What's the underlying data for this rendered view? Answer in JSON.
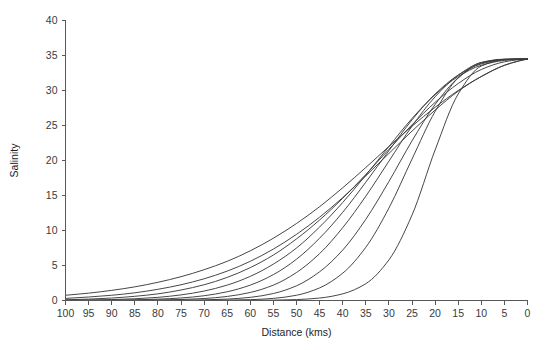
{
  "chart_data": {
    "type": "line",
    "title": "",
    "xlabel": "Distance (kms)",
    "ylabel": "Salinity",
    "xlim": [
      100,
      0
    ],
    "ylim": [
      0,
      40
    ],
    "x_reversed": true,
    "grid": false,
    "legend": "none",
    "xticks": [
      100,
      95,
      90,
      85,
      80,
      75,
      70,
      65,
      60,
      55,
      50,
      45,
      40,
      35,
      30,
      25,
      20,
      15,
      10,
      5,
      0
    ],
    "yticks": [
      0,
      5,
      10,
      15,
      20,
      25,
      30,
      35,
      40
    ],
    "xtick_labels": [
      "100",
      "95",
      "90",
      "85",
      "80",
      "75",
      "70",
      "65",
      "60",
      "55",
      "50",
      "45",
      "40",
      "35",
      "30",
      "25",
      "20",
      "15",
      "10",
      "5",
      "0"
    ],
    "ytick_labels": [
      "0",
      "5",
      "10",
      "15",
      "20",
      "25",
      "30",
      "35",
      "40"
    ],
    "mouth_salinity": 34.5,
    "x": [
      100,
      95,
      90,
      85,
      80,
      75,
      70,
      65,
      60,
      55,
      50,
      45,
      40,
      35,
      30,
      25,
      20,
      15,
      10,
      5,
      2,
      0
    ],
    "series": [
      {
        "name": "curve-1",
        "intrusion_length_km": 115,
        "values": [
          0.75,
          1.05,
          1.45,
          1.95,
          2.6,
          3.4,
          4.4,
          5.6,
          7.1,
          8.9,
          11.0,
          13.4,
          16.1,
          19.0,
          22.0,
          24.9,
          27.6,
          30.0,
          32.0,
          33.6,
          34.2,
          34.5
        ]
      },
      {
        "name": "curve-2",
        "intrusion_length_km": 98,
        "values": [
          0.3,
          0.5,
          0.75,
          1.1,
          1.6,
          2.25,
          3.1,
          4.2,
          5.6,
          7.35,
          9.45,
          11.9,
          14.7,
          17.8,
          21.0,
          24.2,
          27.2,
          29.9,
          32.0,
          33.6,
          34.2,
          34.5
        ]
      },
      {
        "name": "curve-3",
        "intrusion_length_km": 86,
        "values": [
          0.1,
          0.2,
          0.35,
          0.6,
          0.95,
          1.5,
          2.25,
          3.3,
          4.7,
          6.5,
          8.8,
          11.5,
          14.6,
          18.0,
          21.6,
          25.1,
          28.3,
          31.0,
          33.0,
          34.1,
          34.4,
          34.5
        ]
      },
      {
        "name": "curve-4",
        "intrusion_length_km": 74,
        "values": [
          0.03,
          0.07,
          0.13,
          0.25,
          0.45,
          0.8,
          1.35,
          2.2,
          3.45,
          5.2,
          7.5,
          10.5,
          14.0,
          17.9,
          22.0,
          26.0,
          29.4,
          32.0,
          33.6,
          34.3,
          34.45,
          34.5
        ]
      },
      {
        "name": "curve-5",
        "intrusion_length_km": 64,
        "values": [
          0.01,
          0.02,
          0.05,
          0.1,
          0.19,
          0.36,
          0.68,
          1.25,
          2.2,
          3.7,
          5.9,
          8.9,
          12.6,
          16.9,
          21.4,
          25.8,
          29.5,
          32.2,
          33.8,
          34.4,
          34.48,
          34.5
        ]
      },
      {
        "name": "curve-6",
        "intrusion_length_km": 54,
        "values": [
          0.0,
          0.01,
          0.02,
          0.03,
          0.07,
          0.14,
          0.28,
          0.58,
          1.15,
          2.2,
          4.0,
          6.7,
          10.4,
          14.9,
          19.9,
          24.9,
          29.1,
          32.2,
          34.0,
          34.45,
          34.5,
          34.5
        ]
      },
      {
        "name": "curve-7",
        "intrusion_length_km": 44,
        "values": [
          0.0,
          0.0,
          0.0,
          0.01,
          0.02,
          0.04,
          0.09,
          0.2,
          0.45,
          1.0,
          2.1,
          4.1,
          7.2,
          11.6,
          17.0,
          22.8,
          28.0,
          31.8,
          33.9,
          34.45,
          34.5,
          34.5
        ]
      },
      {
        "name": "curve-8",
        "intrusion_length_km": 33,
        "values": [
          0.0,
          0.0,
          0.0,
          0.0,
          0.0,
          0.01,
          0.02,
          0.05,
          0.12,
          0.3,
          0.75,
          1.8,
          3.9,
          7.6,
          13.2,
          20.2,
          27.0,
          31.8,
          34.0,
          34.48,
          34.5,
          34.5
        ]
      },
      {
        "name": "curve-9",
        "intrusion_length_km": 24,
        "values": [
          0.0,
          0.0,
          0.0,
          0.0,
          0.0,
          0.0,
          0.0,
          0.01,
          0.02,
          0.05,
          0.13,
          0.35,
          0.95,
          2.4,
          5.8,
          12.2,
          21.5,
          29.5,
          33.5,
          34.4,
          34.5,
          34.5
        ]
      }
    ]
  },
  "colors": {
    "curve": "#3c3c3e",
    "axis": "#58585a",
    "text": "#1d1d1f",
    "background": "#ffffff"
  }
}
